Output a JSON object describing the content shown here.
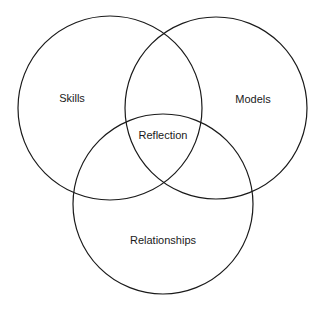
{
  "diagram": {
    "type": "venn",
    "circles": [
      {
        "name": "skills",
        "label": "Skills",
        "cx": 110,
        "cy": 108,
        "r": 92,
        "label_x": 72,
        "label_y": 102
      },
      {
        "name": "models",
        "label": "Models",
        "cx": 216,
        "cy": 108,
        "r": 91,
        "label_x": 253,
        "label_y": 103
      },
      {
        "name": "relationships",
        "label": "Relationships",
        "cx": 163,
        "cy": 204,
        "r": 90,
        "label_x": 163,
        "label_y": 244
      }
    ],
    "center_label": {
      "label": "Reflection",
      "x": 163,
      "y": 139
    },
    "stroke_color": "#1a1a1a",
    "background": "#ffffff"
  }
}
